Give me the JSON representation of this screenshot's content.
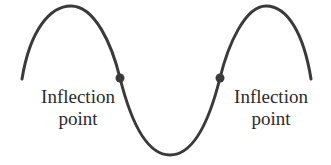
{
  "figure": {
    "curve_color": "#3a3a3a",
    "point_color": "#3a3a3a",
    "text_color": "#2b2b2b"
  },
  "labels": {
    "left": {
      "line1": "Inflection",
      "line2": "point"
    },
    "right": {
      "line1": "Inflection",
      "line2": "point"
    }
  },
  "points": [
    {
      "name": "left-inflection-point",
      "x": 120,
      "y": 78
    },
    {
      "name": "right-inflection-point",
      "x": 220,
      "y": 78
    }
  ]
}
